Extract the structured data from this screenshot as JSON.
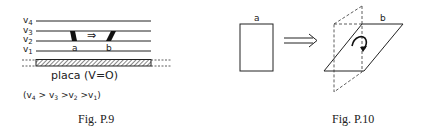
{
  "figures": [
    {
      "id": "P.9",
      "caption": "Fig. P.9",
      "level_labels": [
        "v4",
        "v3",
        "v2",
        "v1"
      ],
      "level_labels_display": [
        {
          "base": "v",
          "sub": "4"
        },
        {
          "base": "v",
          "sub": "3"
        },
        {
          "base": "v",
          "sub": "2"
        },
        {
          "base": "v",
          "sub": "1"
        }
      ],
      "point_labels": [
        "a",
        "b"
      ],
      "arrow": "⇒",
      "plate_label": "placa (V=O)",
      "inequality": "(v4 > v3 > v2 > v1)"
    },
    {
      "id": "P.10",
      "caption": "Fig. P.10",
      "labels": [
        "a",
        "b"
      ],
      "arrow": "⟹"
    }
  ]
}
